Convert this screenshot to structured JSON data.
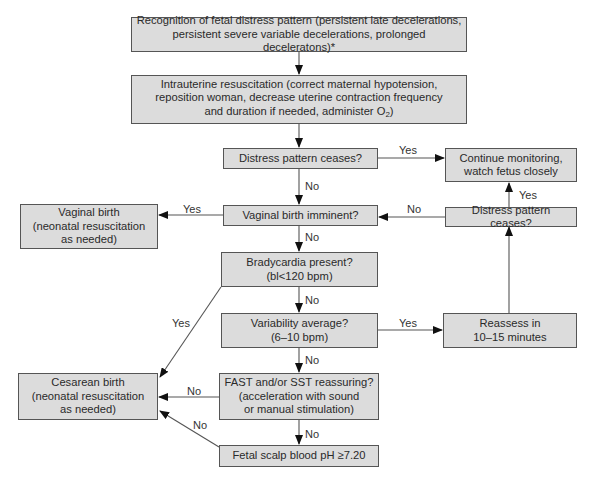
{
  "diagram": {
    "type": "flowchart",
    "nodes": {
      "recognition": {
        "lines": [
          "Recognition of fetal distress pattern (persistent late decelerations,",
          "persistent severe variable decelerations, prolonged deceleratons)*"
        ]
      },
      "resuscitation": {
        "lines": [
          "Intrauterine resuscitation (correct maternal hypotension,",
          "reposition woman, decrease uterine contraction frequency",
          "and duration if needed, administer O"
        ],
        "subscript": "2",
        "suffix": ")"
      },
      "distress_ceases_1": {
        "lines": [
          "Distress pattern ceases?"
        ]
      },
      "continue_monitoring": {
        "lines": [
          "Continue monitoring,",
          "watch fetus closely"
        ]
      },
      "vaginal_birth": {
        "lines": [
          "Vaginal birth",
          "(neonatal resuscitation",
          "as needed)"
        ]
      },
      "vaginal_imminent": {
        "lines": [
          "Vaginal birth imminent?"
        ]
      },
      "distress_ceases_2": {
        "lines": [
          "Distress pattern ceases?"
        ]
      },
      "bradycardia": {
        "lines": [
          "Bradycardia present?",
          "(bl<120 bpm)"
        ]
      },
      "variability": {
        "lines": [
          "Variability average?",
          "(6–10 bpm)"
        ]
      },
      "reassess": {
        "lines": [
          "Reassess in",
          "10–15 minutes"
        ]
      },
      "cesarean": {
        "lines": [
          "Cesarean birth",
          "(neonatal resuscitation",
          "as needed)"
        ]
      },
      "fast_sst": {
        "lines": [
          "FAST and/or SST reassuring?",
          "(acceleration with sound",
          "or manual stimulation)"
        ]
      },
      "scalp_ph": {
        "lines": [
          "Fetal scalp blood pH ≥7.20"
        ]
      }
    },
    "edge_labels": {
      "ceases1_yes": "Yes",
      "ceases1_no": "No",
      "imminent_yes": "Yes",
      "imminent_no": "No",
      "ceases2_no": "No",
      "ceases2_yes": "Yes",
      "brady_yes": "Yes",
      "brady_no": "No",
      "variability_yes": "Yes",
      "variability_no": "No",
      "fast_no_left": "No",
      "fast_no_down": "No",
      "scalp_no": "No"
    }
  }
}
